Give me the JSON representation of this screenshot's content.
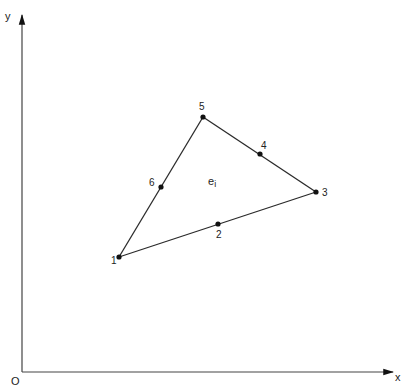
{
  "axes": {
    "x_label": "x",
    "y_label": "y",
    "origin_label": "O",
    "origin": {
      "x": 22,
      "y": 372
    },
    "x_end": {
      "x": 393,
      "y": 372
    },
    "y_end": {
      "x": 22,
      "y": 15
    }
  },
  "element": {
    "label_base": "e",
    "label_sub": "i",
    "label_pos": {
      "x": 208,
      "y": 185
    }
  },
  "nodes": [
    {
      "id": "1",
      "label": "1",
      "x": 119,
      "y": 257,
      "lx": 111,
      "ly": 264
    },
    {
      "id": "2",
      "label": "2",
      "x": 218,
      "y": 224,
      "lx": 216,
      "ly": 238
    },
    {
      "id": "3",
      "label": "3",
      "x": 316,
      "y": 192,
      "lx": 322,
      "ly": 196
    },
    {
      "id": "4",
      "label": "4",
      "x": 260,
      "y": 154,
      "lx": 261,
      "ly": 149
    },
    {
      "id": "5",
      "label": "5",
      "x": 203,
      "y": 117,
      "lx": 199,
      "ly": 110
    },
    {
      "id": "6",
      "label": "6",
      "x": 161,
      "y": 187,
      "lx": 149,
      "ly": 186
    }
  ],
  "edges": [
    {
      "from": "1",
      "to": "3"
    },
    {
      "from": "3",
      "to": "5"
    },
    {
      "from": "5",
      "to": "1"
    }
  ],
  "colors": {
    "line": "#2a2a2a",
    "node": "#111111"
  }
}
